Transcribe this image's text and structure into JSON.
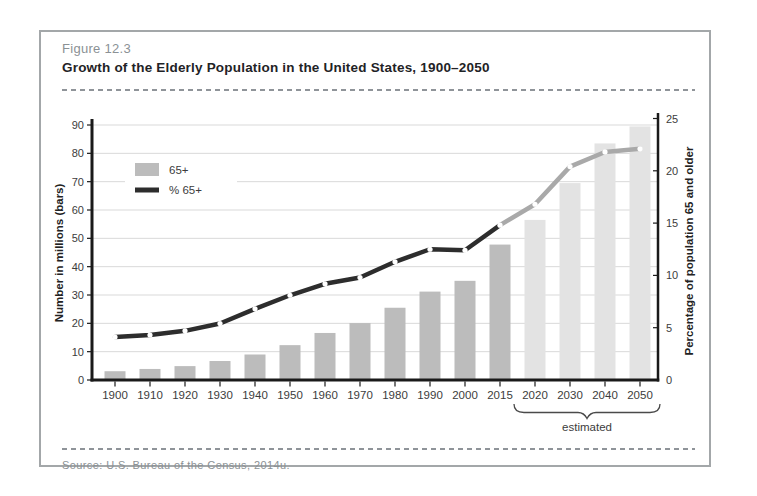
{
  "figure": {
    "label": "Figure 12.3",
    "title": "Growth of the Elderly Population in the United States, 1900–2050",
    "source": "Source:  U.S. Bureau of the Census, 2014u."
  },
  "chart_data": {
    "type": "bar",
    "subtype": "bar-and-line-dual-axis",
    "categories": [
      "1900",
      "1910",
      "1920",
      "1930",
      "1940",
      "1950",
      "1960",
      "1970",
      "1980",
      "1990",
      "2000",
      "2015",
      "2020",
      "2030",
      "2040",
      "2050"
    ],
    "series": [
      {
        "name": "65+",
        "type": "bar",
        "axis": "left",
        "values": [
          3.1,
          3.9,
          4.9,
          6.7,
          9,
          12.3,
          16.6,
          20.1,
          25.5,
          31.2,
          35,
          47.8,
          56.5,
          69.5,
          83.5,
          89.5
        ]
      },
      {
        "name": "% 65+",
        "type": "line",
        "axis": "right",
        "values": [
          4.1,
          4.3,
          4.7,
          5.4,
          6.8,
          8.1,
          9.2,
          9.8,
          11.3,
          12.5,
          12.4,
          14.8,
          16.8,
          20.4,
          21.8,
          22.1
        ]
      }
    ],
    "left_axis": {
      "label": "Number in millions (bars)",
      "range": [
        0,
        90
      ],
      "ticks": [
        0,
        10,
        20,
        30,
        40,
        50,
        60,
        70,
        80,
        90
      ]
    },
    "right_axis": {
      "label": "Percentage of population 65 and older",
      "range": [
        0,
        25
      ],
      "ticks": [
        0,
        5,
        10,
        15,
        20,
        25
      ]
    },
    "legend": [
      {
        "label": "65+",
        "swatch": "bar"
      },
      {
        "label": "% 65+",
        "swatch": "line"
      }
    ],
    "legend_position": "top-left-inside",
    "grid": "horizontal",
    "estimated_label": "estimated",
    "bars_estimated_from_index": 12,
    "line_estimated_from_index": 11,
    "colors": {
      "bar": "#bcbcbc",
      "bar_estimated": "#e3e3e3",
      "line": "#2d2d2d",
      "line_estimated": "#a9a9a9",
      "marker": "#ffffff",
      "grid": "#d9d9d9",
      "axis": "#1a1a1a",
      "frame_border": "#a3a7a9",
      "text_gray": "#8b9195",
      "text_dark": "#1f2326"
    }
  }
}
